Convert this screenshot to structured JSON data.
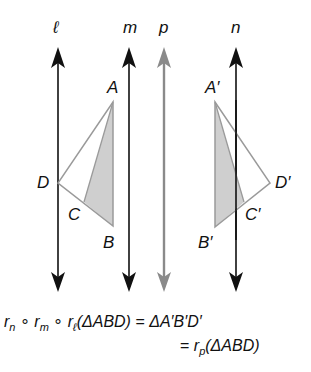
{
  "diagram": {
    "lines": [
      {
        "id": "l",
        "label": "ℓ",
        "x": 58,
        "color": "#111111"
      },
      {
        "id": "m",
        "label": "m",
        "x": 129,
        "color": "#111111"
      },
      {
        "id": "p",
        "label": "p",
        "x": 164,
        "color": "#8a8a8a"
      },
      {
        "id": "n",
        "label": "n",
        "x": 236,
        "color": "#111111"
      }
    ],
    "original_triangle": {
      "points": {
        "A": [
          113,
          102
        ],
        "B": [
          113,
          226
        ],
        "C": [
          84,
          202
        ],
        "D": [
          58,
          183
        ]
      },
      "labels": {
        "A": "A",
        "B": "B",
        "C": "C",
        "D": "D"
      },
      "shaded_region": "ABC"
    },
    "image_triangle": {
      "points": {
        "A'": [
          215,
          102
        ],
        "B'": [
          215,
          227
        ],
        "C'": [
          244,
          202
        ],
        "D'": [
          270,
          183
        ]
      },
      "labels": {
        "A'": "A′",
        "B'": "B′",
        "C'": "C′",
        "D'": "D′"
      },
      "shaded_region": "A'B'C'"
    },
    "colors": {
      "line": "#111111",
      "gray_line": "#8a8a8a",
      "triangle_edge": "#9a9a9a",
      "shade": "#cfcfcf"
    }
  },
  "equation": {
    "line1": {
      "r1": "r",
      "s1": "n",
      "op1": "∘",
      "r2": "r",
      "s2": "m",
      "op2": "∘",
      "r3": "r",
      "s3": "ℓ",
      "arg": "(ΔABD)",
      "eq": "=",
      "rhs": "ΔA′B′D′"
    },
    "line2": {
      "eq": "=",
      "r": "r",
      "s": "p",
      "arg": "(ΔABD)"
    }
  }
}
